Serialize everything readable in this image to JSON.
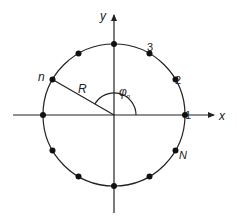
{
  "diagram": {
    "type": "circular-array-geometry",
    "axes": {
      "x_label": "x",
      "y_label": "y"
    },
    "radius_label": "R",
    "angle_label": {
      "symbol": "φ",
      "subscript": "n"
    },
    "element_labels": {
      "first": "1",
      "second": "2",
      "third": "3",
      "nth": "n",
      "last": "N"
    },
    "element_count_shown": 12,
    "colors": {
      "line": "#222222",
      "dot": "#111111",
      "background": "#ffffff"
    }
  }
}
